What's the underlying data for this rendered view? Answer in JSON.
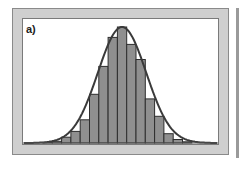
{
  "panel": {
    "label": "a)"
  },
  "colors": {
    "frame": "#cfcfcf",
    "plot_bg": "#ffffff",
    "bar_fill": "#8f8f8f",
    "bar_stroke": "#2e2e2e",
    "curve": "#3a3a3a"
  },
  "chart_data": {
    "type": "bar",
    "title": "",
    "panel_label": "a)",
    "xlabel": "",
    "ylabel": "",
    "grid": false,
    "legend": null,
    "categories": [
      "b1",
      "b2",
      "b3",
      "b4",
      "b5",
      "b6",
      "b7",
      "b8",
      "b9",
      "b10",
      "b11",
      "b12",
      "b13",
      "b14",
      "b15",
      "b16"
    ],
    "values": [
      0.5,
      1.5,
      5,
      10,
      20,
      42,
      66,
      91,
      100,
      85,
      72,
      38,
      23,
      8,
      3,
      1
    ],
    "ylim": [
      0,
      100
    ],
    "overlay": {
      "type": "line",
      "name": "normal fit",
      "shape": "gaussian",
      "peak_bin": "b9"
    }
  }
}
